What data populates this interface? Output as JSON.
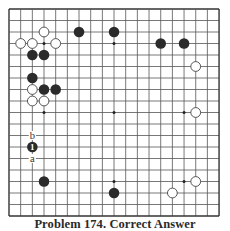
{
  "board": {
    "size": 19,
    "origin": {
      "x": 9,
      "y": 9
    },
    "spacing": {
      "x": 11.67,
      "y": 11.5
    },
    "line_color": "#555555",
    "edge_color": "#333333",
    "stone_radius": 5.3,
    "star_points": [
      [
        3,
        3
      ],
      [
        9,
        3
      ],
      [
        15,
        3
      ],
      [
        3,
        9
      ],
      [
        9,
        9
      ],
      [
        15,
        9
      ],
      [
        3,
        15
      ],
      [
        9,
        15
      ],
      [
        15,
        15
      ]
    ],
    "black_stones": [
      [
        6,
        2
      ],
      [
        9,
        2
      ],
      [
        13,
        3
      ],
      [
        15,
        3
      ],
      [
        2,
        4
      ],
      [
        3,
        4
      ],
      [
        2,
        6
      ],
      [
        3,
        7
      ],
      [
        4,
        7
      ],
      [
        3,
        15
      ],
      [
        9,
        16
      ]
    ],
    "white_stones": [
      [
        3,
        2
      ],
      [
        1,
        3
      ],
      [
        2,
        3
      ],
      [
        4,
        3
      ],
      [
        2,
        7
      ],
      [
        2,
        8
      ],
      [
        3,
        8
      ],
      [
        16,
        5
      ],
      [
        16,
        9
      ],
      [
        16,
        15
      ],
      [
        14,
        16
      ]
    ],
    "numbered_stones": [
      {
        "col": 2,
        "row": 12,
        "color": "black",
        "label": "1"
      }
    ],
    "letter_marks": [
      {
        "col": 2,
        "row": 11,
        "label": "b"
      },
      {
        "col": 2,
        "row": 13,
        "label": "a"
      }
    ],
    "colors": {
      "black_stone": "#2b2b2b",
      "white_stone_fill": "#ffffff",
      "white_stone_stroke": "#444444",
      "label_on_black": "#ffffff",
      "letter": "#333333"
    }
  },
  "caption": {
    "text": "Problem 174. Correct Answer"
  }
}
